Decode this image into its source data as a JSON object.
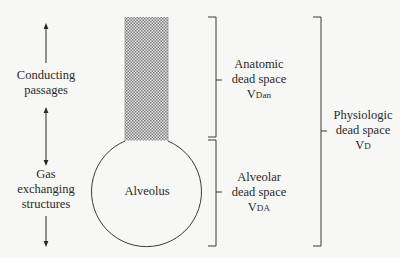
{
  "diagram": {
    "title": "",
    "colors": {
      "background": "#f7f7f5",
      "line": "#3a3a3a",
      "hatch": "#8a8a8a",
      "text": "#2a2a2a"
    },
    "left_labels": {
      "conducting": {
        "line1": "Conducting",
        "line2": "passages"
      },
      "gas_exchange": {
        "line1": "Gas",
        "line2": "exchanging",
        "line3": "structures"
      }
    },
    "alveolus": {
      "label": "Alveolus"
    },
    "brackets": {
      "anatomic": {
        "line1": "Anatomic",
        "line2": "dead space",
        "symbol": "V",
        "subscript": "Dan"
      },
      "alveolar": {
        "line1": "Alveolar",
        "line2": "dead space",
        "symbol": "V",
        "subscript": "DA"
      },
      "physiologic": {
        "line1": "Physiologic",
        "line2": "dead space",
        "symbol": "V",
        "subscript": "D"
      }
    },
    "arrows": [
      {
        "id": "conducting-up",
        "direction": "up"
      },
      {
        "id": "between",
        "direction": "both"
      },
      {
        "id": "gas-down",
        "direction": "down"
      }
    ]
  }
}
